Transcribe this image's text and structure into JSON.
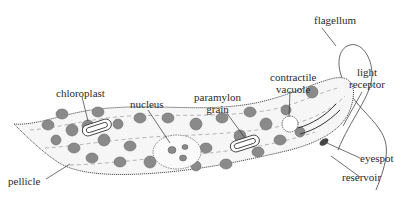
{
  "diagram": {
    "colors": {
      "outline": "#555555",
      "chloroplast_fill": "#8a8a8a",
      "chloroplast_stroke": "#6a6a6a",
      "cell_fill": "#f4f4f4",
      "label_text": "#2a2a2a"
    },
    "labels": {
      "flagellum": "flagellum",
      "light_receptor_line1": "light",
      "light_receptor_line2": "receptor",
      "contractile_vacuole_line1": "contractile",
      "contractile_vacuole_line2": "vacuole",
      "paramylon_grain_line1": "paramylon",
      "paramylon_grain_line2": "grain",
      "nucleus": "nucleus",
      "chloroplast": "chloroplast",
      "pellicle": "pellicle",
      "eyespot": "eyespot",
      "reservoir": "reservoir"
    }
  }
}
